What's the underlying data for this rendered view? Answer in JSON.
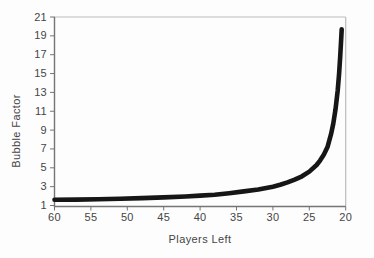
{
  "figure": {
    "background_color": "#fdfdfd",
    "curve_color": "#161616",
    "axis_color": "#757575",
    "frame_color": "#bcbcbc",
    "text_color": "#454545"
  },
  "chart_data": {
    "type": "line",
    "title": "",
    "xlabel": "Players Left",
    "ylabel": "Bubble Factor",
    "legend": "none",
    "grid": "off",
    "x_axis": {
      "min": 60,
      "max": 20,
      "reversed": true,
      "ticks": [
        60,
        55,
        50,
        45,
        40,
        35,
        30,
        25,
        20
      ]
    },
    "y_axis": {
      "min": 1,
      "max": 21,
      "ticks_top_to_bottom": [
        21,
        19,
        17,
        15,
        13,
        11,
        9,
        7,
        5,
        3,
        1
      ]
    },
    "series": [
      {
        "name": "Bubble Factor",
        "style": "thick-solid-black",
        "points": [
          [
            60,
            1.6
          ],
          [
            57,
            1.63
          ],
          [
            54,
            1.67
          ],
          [
            51,
            1.72
          ],
          [
            48,
            1.78
          ],
          [
            45,
            1.86
          ],
          [
            42,
            1.96
          ],
          [
            40,
            2.05
          ],
          [
            38,
            2.15
          ],
          [
            36,
            2.3
          ],
          [
            34,
            2.5
          ],
          [
            32,
            2.7
          ],
          [
            30,
            3.0
          ],
          [
            29,
            3.2
          ],
          [
            28,
            3.45
          ],
          [
            27,
            3.75
          ],
          [
            26,
            4.1
          ],
          [
            25,
            4.6
          ],
          [
            24,
            5.3
          ],
          [
            23.5,
            5.8
          ],
          [
            23,
            6.4
          ],
          [
            22.5,
            7.2
          ],
          [
            22,
            8.6
          ],
          [
            21.7,
            9.7
          ],
          [
            21.4,
            11.2
          ],
          [
            21.1,
            13.2
          ],
          [
            20.9,
            15.0
          ],
          [
            20.75,
            16.8
          ],
          [
            20.65,
            18.3
          ],
          [
            20.55,
            19.7
          ]
        ]
      }
    ]
  }
}
